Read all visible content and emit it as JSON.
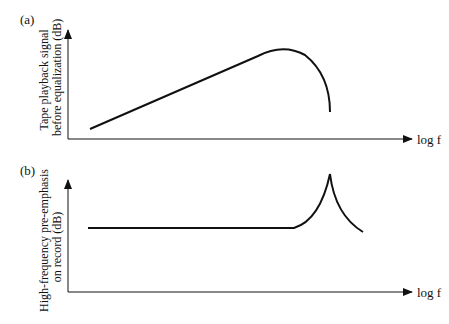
{
  "panels": [
    {
      "tag": "(a)",
      "ylabel_line1": "Tape playback signal",
      "ylabel_line2": "before equalization (dB)",
      "xlabel": "log f",
      "curve": "rises linearly with log f, peaks, then falls sharply at high frequency"
    },
    {
      "tag": "(b)",
      "ylabel_line1": "High-frequency pre-emphasis",
      "ylabel_line2": "on record (dB)",
      "xlabel": "log f",
      "curve": "flat, then sharp resonant peak at high frequency, then decays"
    }
  ],
  "colors": {
    "line": "#111111",
    "background": "#ffffff"
  }
}
